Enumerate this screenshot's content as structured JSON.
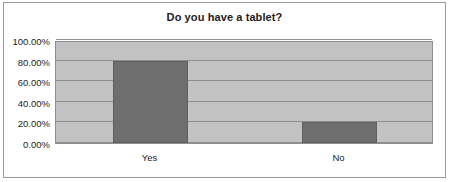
{
  "chart_data": {
    "type": "bar",
    "title": "Do you have a tablet?",
    "xlabel": "",
    "ylabel": "",
    "categories": [
      "Yes",
      "No"
    ],
    "values": [
      0.795,
      0.205
    ],
    "value_labels": [
      "79.50%",
      "20.50%"
    ],
    "ylim": [
      0,
      1
    ],
    "y_ticks": [
      0,
      0.2,
      0.4,
      0.6,
      0.8,
      1
    ],
    "y_tick_labels": [
      "0.00%",
      "20.00%",
      "40.00%",
      "60.00%",
      "80.00%",
      "100.00%"
    ],
    "grid": true,
    "legend": false,
    "legend_position": "none",
    "colors": {
      "bar_fill": "#6e6e6e",
      "bar_border": "#5e5e5e",
      "plot_background": "#c2c2c2",
      "gridline": "#8e8e8e",
      "text": "#1c1c1c",
      "figure_border": "#9a9a9a",
      "figure_background": "#ffffff"
    }
  }
}
